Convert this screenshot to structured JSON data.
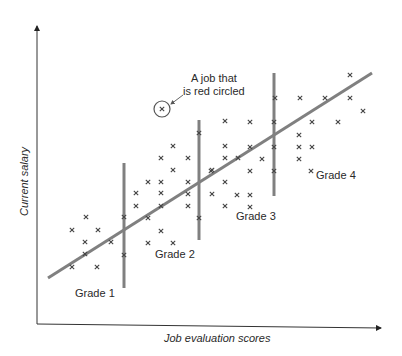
{
  "chart_data": {
    "type": "scatter",
    "title": "",
    "xlabel": "Job evaluation scores",
    "ylabel": "Current salary",
    "grid": false,
    "legend": null,
    "axis_ticks": "none",
    "colors": {
      "axis": "#333333",
      "points": "#444444",
      "trend_line": "#808080",
      "grade_divider": "#808080",
      "circle": "#555555"
    },
    "trend_line": {
      "from": [
        48,
        278
      ],
      "to": [
        372,
        73
      ],
      "label": "pay line (regression)"
    },
    "grade_dividers": [
      {
        "x": 124,
        "y_top": 163,
        "y_bottom": 288
      },
      {
        "x": 199,
        "y_top": 120,
        "y_bottom": 240
      },
      {
        "x": 274,
        "y_top": 73,
        "y_bottom": 196
      }
    ],
    "grade_labels": [
      {
        "text": "Grade 1",
        "x": 74,
        "y": 287
      },
      {
        "text": "Grade 2",
        "x": 155,
        "y": 248
      },
      {
        "text": "Grade 3",
        "x": 236,
        "y": 209
      },
      {
        "text": "Grade 4",
        "x": 316,
        "y": 168
      }
    ],
    "annotation": {
      "line1": "A job that",
      "line2": "is red circled",
      "point": [
        162,
        109
      ],
      "circle_radius": 8
    },
    "points": [
      [
        86,
        217
      ],
      [
        72,
        230
      ],
      [
        98,
        230
      ],
      [
        85,
        242
      ],
      [
        111,
        242
      ],
      [
        85,
        254
      ],
      [
        72,
        267
      ],
      [
        97,
        267
      ],
      [
        124,
        217
      ],
      [
        124,
        255
      ],
      [
        173,
        146
      ],
      [
        161,
        158
      ],
      [
        188,
        158
      ],
      [
        173,
        170
      ],
      [
        148,
        182
      ],
      [
        161,
        182
      ],
      [
        188,
        182
      ],
      [
        136,
        193
      ],
      [
        161,
        193
      ],
      [
        188,
        194
      ],
      [
        136,
        206
      ],
      [
        161,
        206
      ],
      [
        188,
        206
      ],
      [
        148,
        218
      ],
      [
        161,
        231
      ],
      [
        148,
        243
      ],
      [
        173,
        243
      ],
      [
        199,
        218
      ],
      [
        199,
        133
      ],
      [
        225,
        146
      ],
      [
        225,
        158
      ],
      [
        212,
        170
      ],
      [
        225,
        182
      ],
      [
        212,
        194
      ],
      [
        225,
        206
      ],
      [
        225,
        121
      ],
      [
        250,
        122
      ],
      [
        250,
        147
      ],
      [
        238,
        158
      ],
      [
        262,
        159
      ],
      [
        250,
        171
      ],
      [
        211,
        171
      ],
      [
        237,
        195
      ],
      [
        250,
        195
      ],
      [
        250,
        207
      ],
      [
        274,
        122
      ],
      [
        274,
        147
      ],
      [
        274,
        171
      ],
      [
        350,
        75
      ],
      [
        275,
        98
      ],
      [
        300,
        98
      ],
      [
        325,
        98
      ],
      [
        350,
        98
      ],
      [
        363,
        111
      ],
      [
        312,
        122
      ],
      [
        338,
        122
      ],
      [
        299,
        135
      ],
      [
        299,
        147
      ],
      [
        312,
        147
      ],
      [
        299,
        159
      ],
      [
        311,
        171
      ],
      [
        162,
        109
      ]
    ],
    "axes": {
      "origin": [
        37,
        324
      ],
      "y_top": [
        37,
        24
      ],
      "x_right": [
        383,
        328
      ]
    }
  },
  "labels": {
    "ylabel": "Current salary",
    "xlabel": "Job evaluation scores",
    "annotation_line1": "A job that",
    "annotation_line2": "is red circled",
    "grade1": "Grade 1",
    "grade2": "Grade 2",
    "grade3": "Grade 3",
    "grade4": "Grade 4"
  }
}
